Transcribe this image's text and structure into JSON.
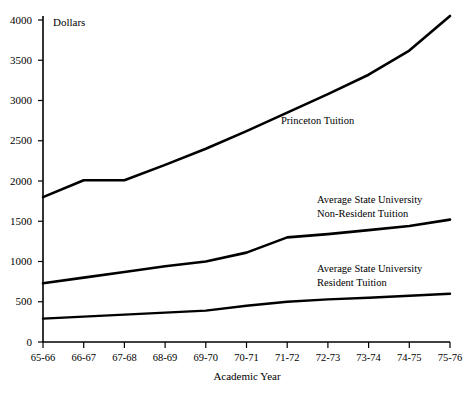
{
  "chart_data": {
    "type": "line",
    "title": "",
    "unit_label": "Dollars",
    "xlabel": "Academic Year",
    "ylabel": "",
    "grid": false,
    "legend_position": "inline-annotations",
    "ylim": [
      0,
      4000
    ],
    "ytick_step": 500,
    "yticks": [
      "0",
      "500",
      "1000",
      "1500",
      "2000",
      "2500",
      "3000",
      "3500",
      "4000"
    ],
    "categories": [
      "65-66",
      "66-67",
      "67-68",
      "68-69",
      "69-70",
      "70-71",
      "71-72",
      "72-73",
      "73-74",
      "74-75",
      "75-76"
    ],
    "series": [
      {
        "name": "Princeton Tuition",
        "values": [
          1800,
          2010,
          2010,
          2200,
          2400,
          2620,
          2850,
          3080,
          3320,
          3620,
          4050
        ]
      },
      {
        "name": "Average State University Non-Resident Tuition",
        "values": [
          730,
          800,
          870,
          940,
          1000,
          1110,
          1300,
          1340,
          1390,
          1440,
          1520
        ]
      },
      {
        "name": "Average State University Resident Tuition",
        "values": [
          290,
          315,
          340,
          365,
          390,
          450,
          500,
          530,
          550,
          575,
          600
        ]
      }
    ],
    "annotations": [
      {
        "text": "Princeton Tuition",
        "series": "Princeton Tuition"
      },
      {
        "text_line1": "Average State University",
        "text_line2": "Non-Resident Tuition",
        "series": "Average State University Non-Resident Tuition"
      },
      {
        "text_line1": "Average State University",
        "text_line2": "Resident Tuition",
        "series": "Average State University Resident Tuition"
      }
    ],
    "colors": {
      "line": "#000000",
      "axis": "#000000",
      "background": "#ffffff"
    }
  }
}
